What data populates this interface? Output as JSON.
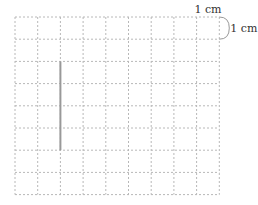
{
  "diagram": {
    "grid": {
      "cols": 9,
      "rows": 8,
      "left": 15,
      "top": 17,
      "cell_w": 22.7,
      "cell_h": 22.2,
      "line_color": "#b8b8b8"
    },
    "scale_labels": {
      "horizontal": "1 cm",
      "vertical": "1 cm"
    },
    "segment": {
      "col_line": 2,
      "from_row": 2,
      "to_row": 6,
      "color": "#999999",
      "length_cm": 4
    }
  }
}
